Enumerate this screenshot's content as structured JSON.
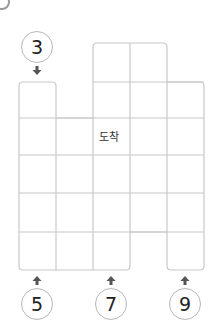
{
  "puzzle": {
    "goal_label": "도착",
    "start_top": {
      "number": "3"
    },
    "start_bottom": [
      {
        "number": "5"
      },
      {
        "number": "7"
      },
      {
        "number": "9"
      }
    ]
  },
  "colors": {
    "grid_line": "#c8c8c8",
    "circle_border": "#b8b8b8",
    "arrow": "#555555",
    "text": "#222222"
  }
}
